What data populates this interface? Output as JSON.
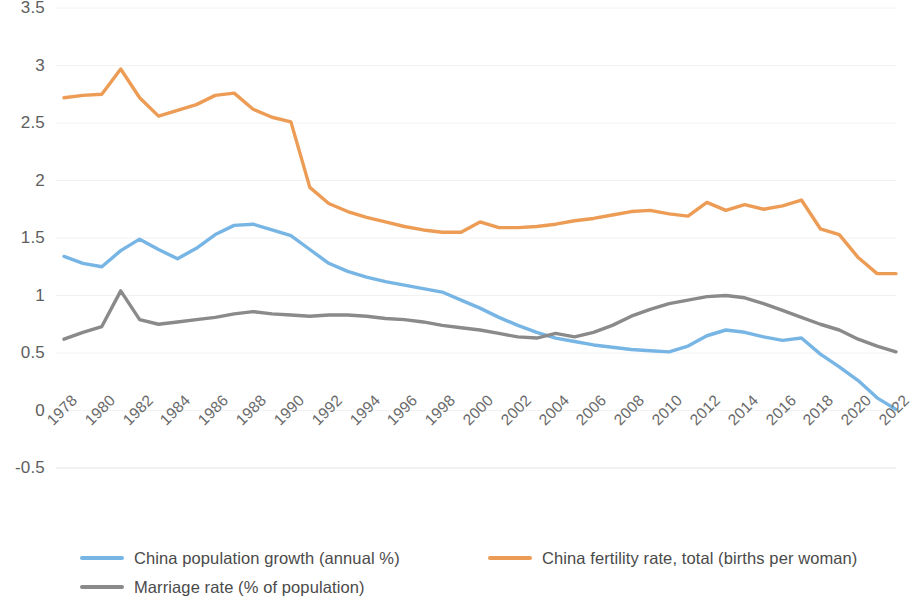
{
  "chart_data": {
    "type": "line",
    "title": "",
    "xlabel": "",
    "ylabel": "",
    "ylim": [
      -0.5,
      3.5
    ],
    "xlim": [
      1978,
      2022
    ],
    "grid": true,
    "legend_position": "bottom",
    "y_ticks": [
      "3.5",
      "3",
      "2.5",
      "2",
      "1.5",
      "1",
      "0.5",
      "0",
      "-0.5"
    ],
    "y_tick_values": [
      3.5,
      3,
      2.5,
      2,
      1.5,
      1,
      0.5,
      0,
      -0.5
    ],
    "x_ticks": [
      "1978",
      "1980",
      "1982",
      "1984",
      "1986",
      "1988",
      "1990",
      "1992",
      "1994",
      "1996",
      "1998",
      "2000",
      "2002",
      "2004",
      "2006",
      "2008",
      "2010",
      "2012",
      "2014",
      "2016",
      "2018",
      "2020",
      "2022"
    ],
    "x": [
      1978,
      1979,
      1980,
      1981,
      1982,
      1983,
      1984,
      1985,
      1986,
      1987,
      1988,
      1989,
      1990,
      1991,
      1992,
      1993,
      1994,
      1995,
      1996,
      1997,
      1998,
      1999,
      2000,
      2001,
      2002,
      2003,
      2004,
      2005,
      2006,
      2007,
      2008,
      2009,
      2010,
      2011,
      2012,
      2013,
      2014,
      2015,
      2016,
      2017,
      2018,
      2019,
      2020,
      2021,
      2022
    ],
    "series": [
      {
        "name": "China population growth (annual %)",
        "color": "#77b5e5",
        "values": [
          1.34,
          1.28,
          1.25,
          1.39,
          1.49,
          1.4,
          1.32,
          1.41,
          1.53,
          1.61,
          1.62,
          1.57,
          1.52,
          1.4,
          1.28,
          1.21,
          1.16,
          1.12,
          1.09,
          1.06,
          1.03,
          0.96,
          0.89,
          0.81,
          0.74,
          0.68,
          0.63,
          0.6,
          0.57,
          0.55,
          0.53,
          0.52,
          0.51,
          0.56,
          0.65,
          0.7,
          0.68,
          0.64,
          0.61,
          0.63,
          0.49,
          0.38,
          0.26,
          0.11,
          0.01
        ]
      },
      {
        "name": "China fertility rate, total (births per woman)",
        "color": "#ed9c56",
        "values": [
          2.72,
          2.74,
          2.75,
          2.97,
          2.72,
          2.56,
          2.61,
          2.66,
          2.74,
          2.76,
          2.62,
          2.55,
          2.51,
          1.94,
          1.8,
          1.73,
          1.68,
          1.64,
          1.6,
          1.57,
          1.55,
          1.55,
          1.64,
          1.59,
          1.59,
          1.6,
          1.62,
          1.65,
          1.67,
          1.7,
          1.73,
          1.74,
          1.71,
          1.69,
          1.81,
          1.74,
          1.79,
          1.75,
          1.78,
          1.83,
          1.58,
          1.53,
          1.33,
          1.19,
          1.19
        ]
      },
      {
        "name": "Marriage rate (% of population)",
        "color": "#8a8a8a",
        "values": [
          0.62,
          0.68,
          0.73,
          1.04,
          0.79,
          0.75,
          0.77,
          0.79,
          0.81,
          0.84,
          0.86,
          0.84,
          0.83,
          0.82,
          0.83,
          0.83,
          0.82,
          0.8,
          0.79,
          0.77,
          0.74,
          0.72,
          0.7,
          0.67,
          0.64,
          0.63,
          0.67,
          0.64,
          0.68,
          0.74,
          0.82,
          0.88,
          0.93,
          0.96,
          0.99,
          1.0,
          0.98,
          0.93,
          0.87,
          0.81,
          0.75,
          0.7,
          0.62,
          0.56,
          0.51
        ]
      }
    ]
  },
  "legend": {
    "items": [
      {
        "label": "China population growth (annual %)",
        "color": "#77b5e5"
      },
      {
        "label": "China fertility rate, total (births per woman)",
        "color": "#ed9c56"
      },
      {
        "label": "Marriage rate (% of population)",
        "color": "#8a8a8a"
      }
    ]
  }
}
